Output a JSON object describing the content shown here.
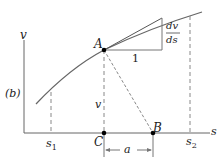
{
  "diagram": {
    "panel_label": "(b)",
    "axis_y_label": "v",
    "axis_x_label": "s",
    "point_A": "A",
    "point_B": "B",
    "point_C": "C",
    "segment_AC_label": "v",
    "distance_label": "a",
    "slope_numerator": "dv",
    "slope_denominator": "ds",
    "slope_run_label": "1",
    "tick_s1": "s",
    "tick_s1_sub": "1",
    "tick_s2": "s",
    "tick_s2_sub": "2",
    "colors": {
      "line": "#555555",
      "curve": "#666666",
      "dot": "#000000"
    }
  }
}
